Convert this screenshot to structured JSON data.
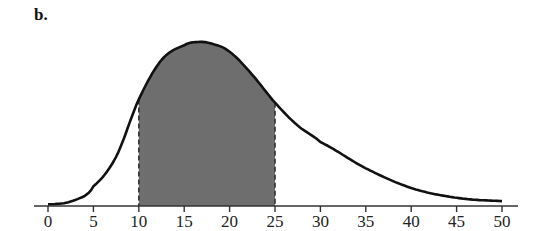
{
  "panel_label": "b.",
  "colors": {
    "curve": "#111111",
    "shade": "#6e6e6e",
    "axis": "#333333",
    "boundary_dash": "#333333"
  },
  "chart_data": {
    "type": "area",
    "title": "",
    "panel_label": "b.",
    "xlabel": "",
    "ylabel": "",
    "xlim": [
      0,
      50
    ],
    "x_ticks": [
      0,
      5,
      10,
      15,
      20,
      25,
      30,
      35,
      40,
      45,
      50
    ],
    "x_tick_labels": [
      "0",
      "5",
      "10",
      "15",
      "20",
      "25",
      "30",
      "35",
      "40",
      "45",
      "50"
    ],
    "y_axis_shown": false,
    "grid": false,
    "legend": null,
    "curve": {
      "x": [
        0,
        2,
        4,
        5,
        7.5,
        10,
        12.5,
        15,
        16.5,
        18,
        20,
        22.5,
        25,
        27.5,
        30,
        35,
        40,
        45,
        50
      ],
      "relative_height": [
        0.01,
        0.02,
        0.06,
        0.12,
        0.3,
        0.65,
        0.89,
        0.98,
        1.0,
        0.99,
        0.94,
        0.8,
        0.63,
        0.49,
        0.39,
        0.23,
        0.11,
        0.05,
        0.03
      ]
    },
    "shaded_region": {
      "from": 10,
      "to": 25
    }
  }
}
